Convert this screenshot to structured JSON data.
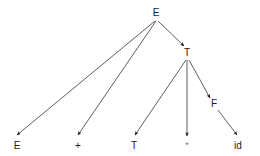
{
  "diagram": {
    "type": "parse-tree",
    "title": "",
    "canvas": {
      "width": 260,
      "height": 156
    },
    "style": {
      "edge_color": "#4d4d4d",
      "edge_width": 0.9,
      "arrow_color": "#1a1a1a",
      "label_color": "#1a1a1a",
      "faint_label_color": "#7a7a7a",
      "background": "#ffffff"
    },
    "nodes": [
      {
        "id": "E-root",
        "label": "E",
        "x": 156,
        "y": 13,
        "role": "root",
        "faint": false
      },
      {
        "id": "T-mid",
        "label": "T",
        "x": 187,
        "y": 53,
        "role": "internal",
        "faint": false
      },
      {
        "id": "F-mid",
        "label": "F",
        "x": 214,
        "y": 104,
        "role": "internal",
        "faint": false
      },
      {
        "id": "E-leaf",
        "label": "E",
        "x": 17,
        "y": 146,
        "role": "leaf",
        "faint": false
      },
      {
        "id": "plus-leaf",
        "label": "+",
        "x": 78,
        "y": 146,
        "role": "leaf",
        "faint": false
      },
      {
        "id": "T-leaf",
        "label": "T",
        "x": 134,
        "y": 146,
        "role": "leaf",
        "faint": false
      },
      {
        "id": "star-leaf",
        "label": "*",
        "x": 187,
        "y": 145,
        "role": "leaf",
        "faint": true
      },
      {
        "id": "id-leaf",
        "label": "id",
        "x": 238,
        "y": 146,
        "role": "leaf",
        "faint": false
      }
    ],
    "edges": [
      {
        "id": "edge-E-to-E",
        "from": "E-root",
        "to": "E-leaf",
        "x1": 155,
        "y1": 21,
        "x2": 17,
        "y2": 135
      },
      {
        "id": "edge-E-to-plus",
        "from": "E-root",
        "to": "plus-leaf",
        "x1": 156,
        "y1": 21,
        "x2": 78,
        "y2": 135
      },
      {
        "id": "edge-E-to-T",
        "from": "E-root",
        "to": "T-mid",
        "x1": 158,
        "y1": 21,
        "x2": 184,
        "y2": 46
      },
      {
        "id": "edge-T-to-T",
        "from": "T-mid",
        "to": "T-leaf",
        "x1": 186,
        "y1": 60,
        "x2": 135,
        "y2": 135
      },
      {
        "id": "edge-T-to-star",
        "from": "T-mid",
        "to": "star-leaf",
        "x1": 187,
        "y1": 60,
        "x2": 187,
        "y2": 136
      },
      {
        "id": "edge-T-to-F",
        "from": "T-mid",
        "to": "F-mid",
        "x1": 189,
        "y1": 60,
        "x2": 210,
        "y2": 98
      },
      {
        "id": "edge-F-to-id",
        "from": "F-mid",
        "to": "id-leaf",
        "x1": 218,
        "y1": 110,
        "x2": 237,
        "y2": 135
      }
    ]
  }
}
